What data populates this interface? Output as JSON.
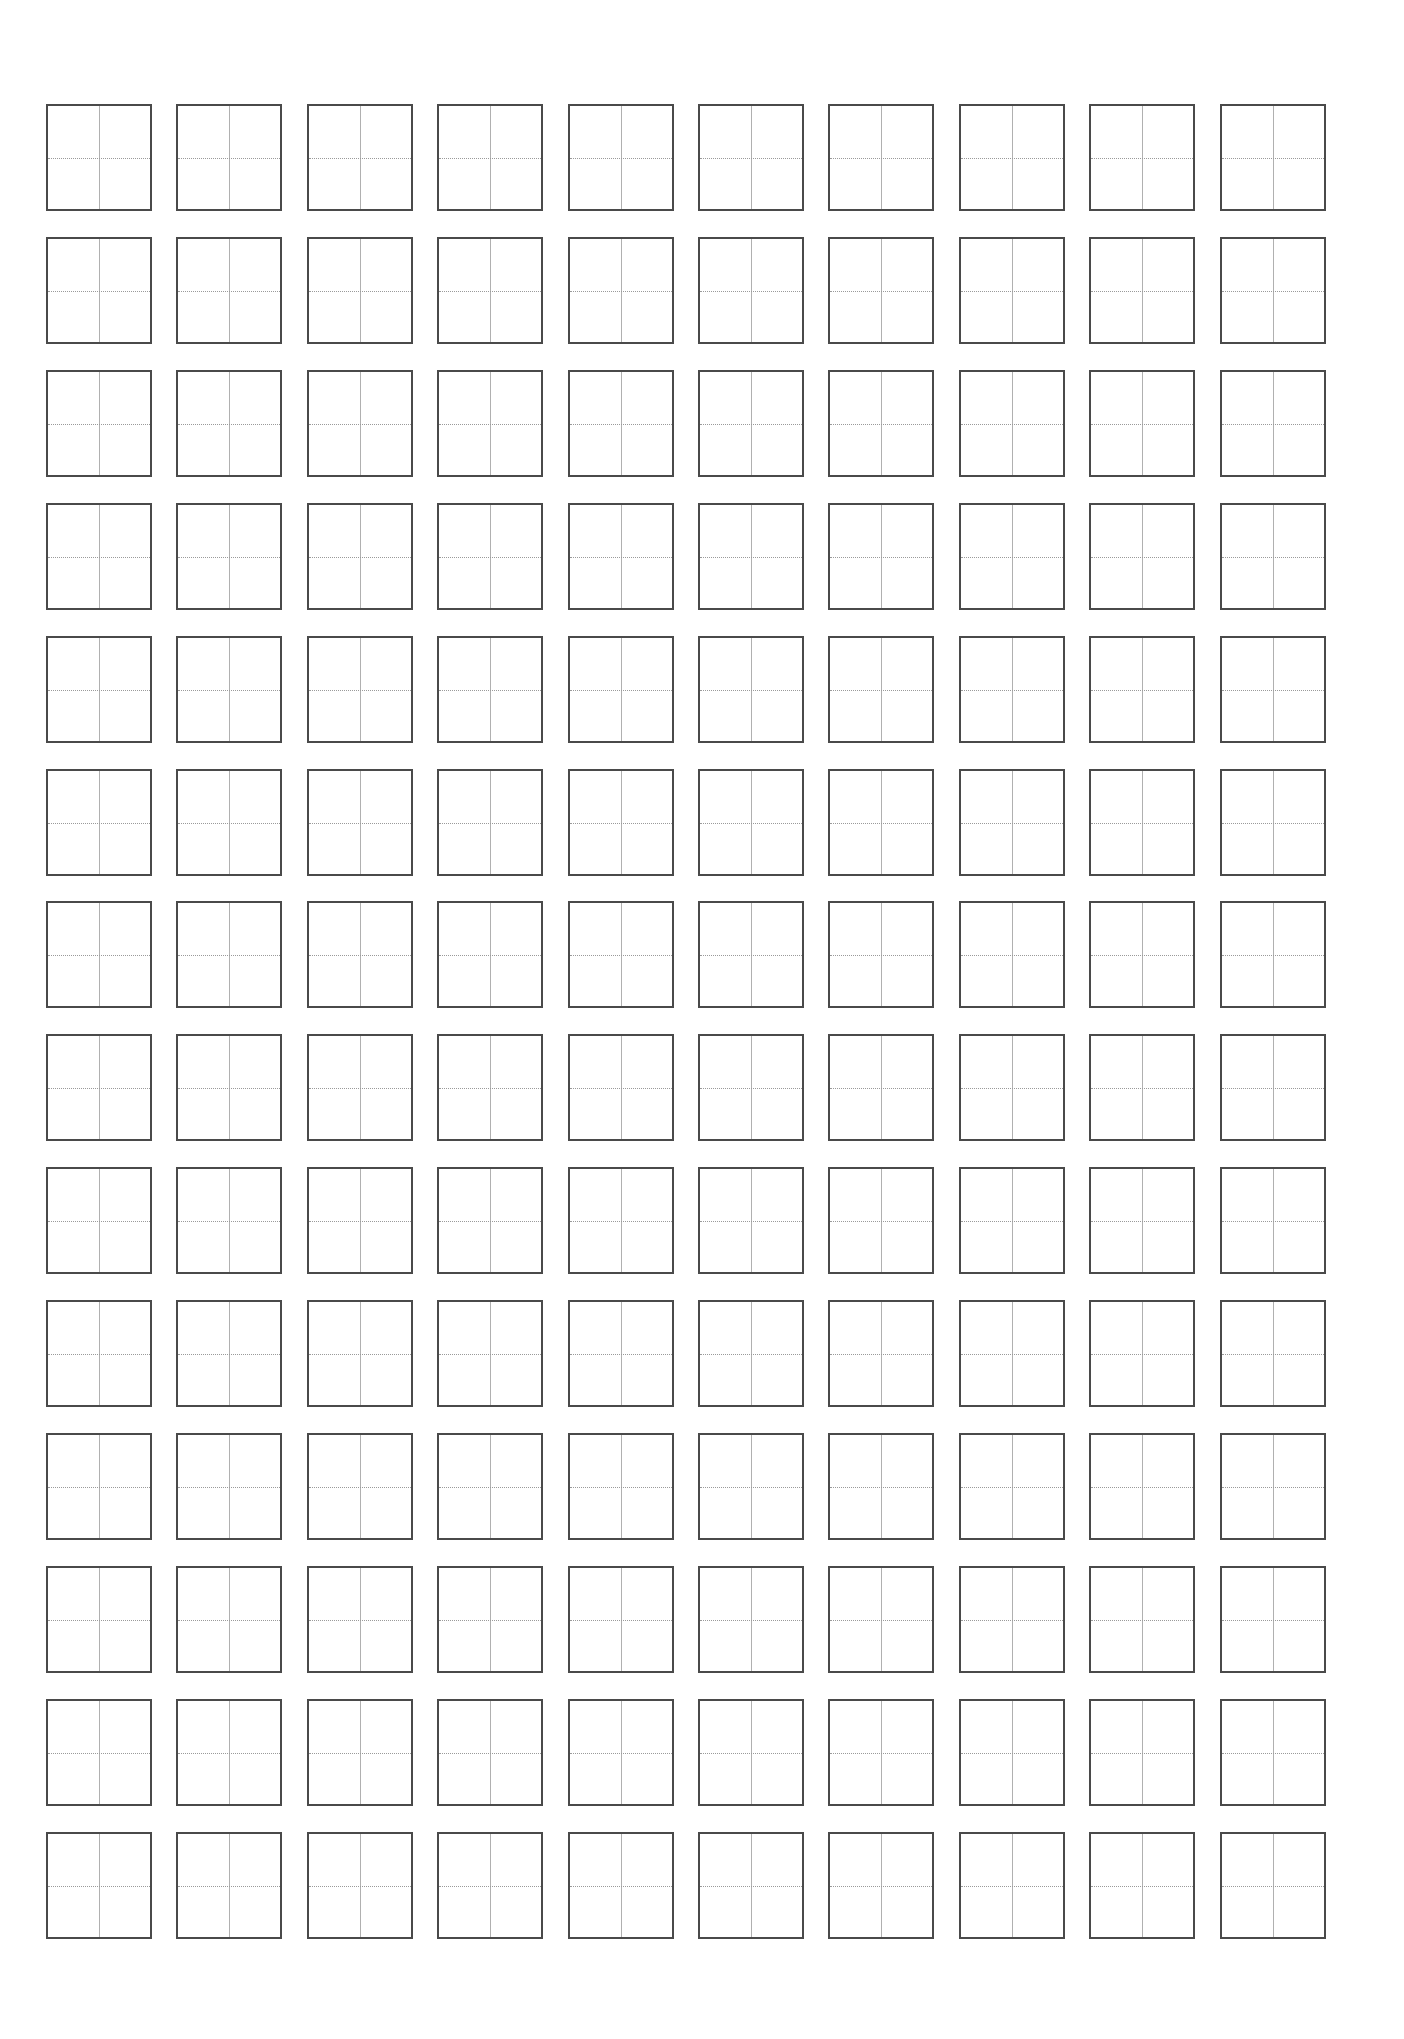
{
  "sheet": {
    "type": "tianzige-practice-grid",
    "rows": 14,
    "columns": 10,
    "total_cells": 140,
    "cell_width_px": 106,
    "cell_height_px": 107,
    "origin_x_px": 46,
    "origin_y_px": 104,
    "column_pitch_px": 130.4,
    "row_pitch_px": 132.9,
    "colors": {
      "background": "#ffffff",
      "cell_border": "#4a4a4a",
      "vertical_guide": "#b0b0b0",
      "horizontal_guide": "#9a9a9a"
    },
    "guides": {
      "vertical": "solid",
      "horizontal": "dotted"
    }
  }
}
